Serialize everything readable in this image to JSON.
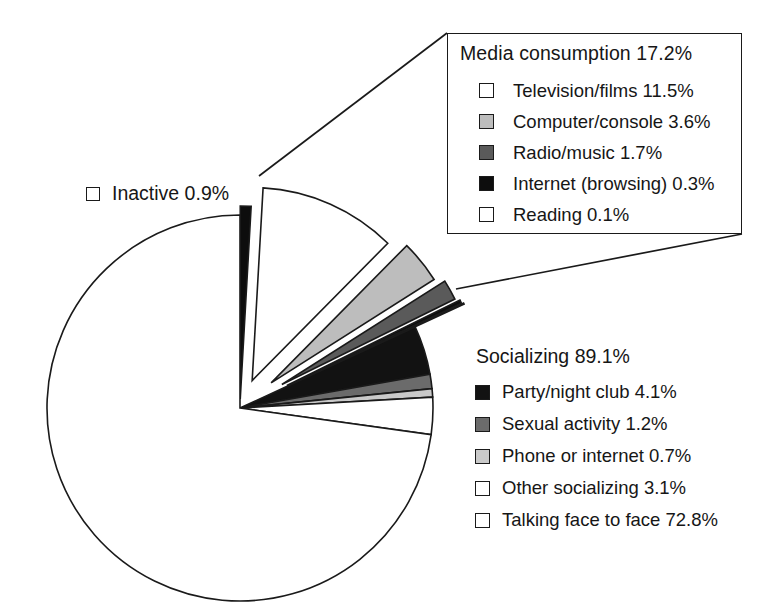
{
  "chart_data": {
    "type": "pie",
    "title": "",
    "xlabel": "",
    "ylabel": "",
    "units": "percent",
    "note": "Exploded pie of daily time use; two grouped callouts detail the Media consumption and Socializing wedges.",
    "groups": [
      {
        "name": "Media consumption",
        "total_label": "Media consumption 17.2%",
        "total": 17.2,
        "callout": "box",
        "slices": [
          {
            "label": "Television/films 11.5%",
            "name": "Television/films",
            "value": 11.5,
            "color": "#ffffff"
          },
          {
            "label": "Computer/console 3.6%",
            "name": "Computer/console",
            "value": 3.6,
            "color": "#bdbdbd"
          },
          {
            "label": "Radio/music 1.7%",
            "name": "Radio/music",
            "value": 1.7,
            "color": "#5a5a5a"
          },
          {
            "label": "Internet (browsing) 0.3%",
            "name": "Internet (browsing)",
            "value": 0.3,
            "color": "#0d0d0d"
          },
          {
            "label": "Reading 0.1%",
            "name": "Reading",
            "value": 0.1,
            "color": "#ffffff"
          }
        ]
      },
      {
        "name": "Socializing",
        "total_label": "Socializing 89.1%",
        "total": 89.1,
        "callout": "inline",
        "slices": [
          {
            "label": "Party/night club 4.1%",
            "name": "Party/night club",
            "value": 4.1,
            "color": "#121212"
          },
          {
            "label": "Sexual activity 1.2%",
            "name": "Sexual activity",
            "value": 1.2,
            "color": "#6b6b6b"
          },
          {
            "label": "Phone or internet 0.7%",
            "name": "Phone or internet",
            "value": 0.7,
            "color": "#c9c9c9"
          },
          {
            "label": "Other socializing 3.1%",
            "name": "Other socializing",
            "value": 3.1,
            "color": "#ffffff"
          },
          {
            "label": "Talking face to face 72.8%",
            "name": "Talking face to face",
            "value": 72.8,
            "color": "#ffffff"
          }
        ]
      },
      {
        "name": "Inactive",
        "total_label": "Inactive 0.9%",
        "total": 0.9,
        "callout": "label",
        "slices": [
          {
            "label": "Inactive 0.9%",
            "name": "Inactive",
            "value": 0.9,
            "color": "#0d0d0d"
          }
        ]
      }
    ]
  },
  "media_box": {
    "title": "Media consumption 17.2%",
    "items": [
      {
        "label": "Television/films 11.5%",
        "swatch": "#ffffff"
      },
      {
        "label": "Computer/console 3.6%",
        "swatch": "#bdbdbd"
      },
      {
        "label": "Radio/music 1.7%",
        "swatch": "#5a5a5a"
      },
      {
        "label": "Internet (browsing) 0.3%",
        "swatch": "#0d0d0d"
      },
      {
        "label": "Reading 0.1%",
        "swatch": "#ffffff"
      }
    ]
  },
  "socializing_legend": {
    "title": "Socializing 89.1%",
    "items": [
      {
        "label": "Party/night club 4.1%",
        "swatch": "#121212"
      },
      {
        "label": "Sexual activity 1.2%",
        "swatch": "#6b6b6b"
      },
      {
        "label": "Phone or internet 0.7%",
        "swatch": "#c9c9c9"
      },
      {
        "label": "Other socializing 3.1%",
        "swatch": "#ffffff"
      },
      {
        "label": "Talking face to face 72.8%",
        "swatch": "#ffffff"
      }
    ]
  },
  "inactive_label": {
    "label": "Inactive 0.9%",
    "swatch": "#141414"
  },
  "colors": {
    "stroke": "#1a1a1a",
    "background": "#ffffff",
    "text": "#161616"
  }
}
